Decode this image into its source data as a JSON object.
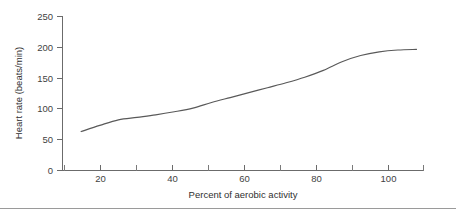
{
  "chart_data": {
    "type": "line",
    "title": "",
    "xlabel": "Percent of aerobic activity",
    "ylabel": "Heart rate (beats/min)",
    "xlim": [
      10,
      107
    ],
    "ylim": [
      0,
      250
    ],
    "grid": false,
    "legend": "none",
    "x_ticks": [
      20,
      40,
      60,
      80,
      100
    ],
    "x_tick_labels": [
      "20",
      "40",
      "60",
      "80",
      "100"
    ],
    "x_minor_ticks": [
      10,
      30,
      50,
      70,
      90,
      107
    ],
    "y_ticks": [
      0,
      50,
      100,
      150,
      200,
      250
    ],
    "y_tick_labels": [
      "0",
      "50",
      "100",
      "150",
      "200",
      "250"
    ],
    "series": [
      {
        "name": "Heart rate response",
        "color": "#595959",
        "x": [
          15,
          20,
          25,
          30,
          35,
          40,
          45,
          50,
          55,
          60,
          65,
          70,
          75,
          80,
          85,
          90,
          95,
          100,
          105
        ],
        "values": [
          63,
          73,
          82,
          86,
          90,
          95,
          101,
          110,
          118,
          126,
          134,
          142,
          151,
          162,
          176,
          186,
          192,
          195,
          196
        ]
      }
    ]
  },
  "figure": {
    "background_color": "#ffffff",
    "axis_color": "#6b6b6b",
    "line_color": "#595959",
    "text_color": "#3f3f3f",
    "footer_rule_color": "#9a9a9a"
  }
}
